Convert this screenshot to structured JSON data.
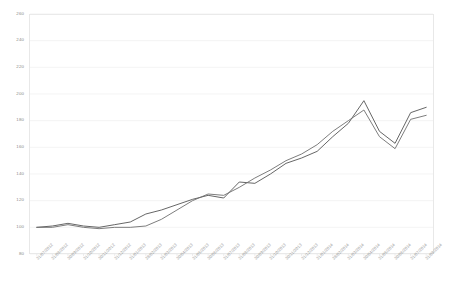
{
  "chart_data": {
    "type": "line",
    "title": "",
    "subtitle": "",
    "xlabel": "",
    "ylabel": "",
    "ylim": [
      80,
      260
    ],
    "ytick_step": 20,
    "yticks": [
      260,
      240,
      220,
      200,
      180,
      160,
      140,
      120,
      100,
      80
    ],
    "ytick_labels": [
      "260",
      "240",
      "220",
      "200",
      "180",
      "160",
      "140",
      "120",
      "100",
      "80"
    ],
    "grid": true,
    "grid_axis": "y",
    "legend": false,
    "legend_position": "none",
    "xtick_rotation": -45,
    "categories": [
      "31/07/2012",
      "31/08/2012",
      "30/09/2012",
      "31/10/2012",
      "30/11/2012",
      "31/12/2012",
      "31/01/2013",
      "28/02/2013",
      "31/03/2013",
      "30/04/2013",
      "31/05/2013",
      "30/06/2013",
      "31/07/2013",
      "31/08/2013",
      "30/09/2013",
      "31/10/2013",
      "30/11/2013",
      "31/12/2013",
      "31/01/2014",
      "28/02/2014",
      "31/03/2014",
      "30/04/2014",
      "31/05/2014",
      "30/06/2014",
      "31/07/2014",
      "31/08/2014"
    ],
    "series": [
      {
        "name": "Series 1",
        "color": "#555555",
        "values": [
          100,
          101,
          103,
          101,
          100,
          102,
          104,
          110,
          113,
          117,
          121,
          124,
          122,
          134,
          133,
          140,
          148,
          152,
          157,
          168,
          178,
          195,
          172,
          163,
          186,
          190
        ]
      },
      {
        "name": "Series 2",
        "color": "#6e6e6e",
        "values": [
          100,
          100,
          102,
          100,
          99,
          100,
          100,
          101,
          106,
          113,
          120,
          125,
          124,
          130,
          137,
          143,
          150,
          155,
          162,
          172,
          180,
          188,
          168,
          159,
          181,
          184
        ]
      }
    ]
  },
  "axes": {
    "plot_left": 29,
    "plot_top": 14,
    "plot_width": 405,
    "plot_height": 240
  }
}
